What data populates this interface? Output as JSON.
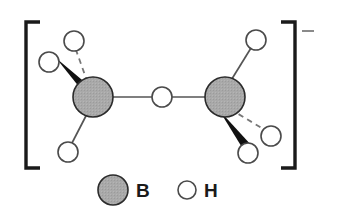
{
  "figure": {
    "charge_symbol": "–",
    "colors": {
      "boron_fill": "#a8a8a8",
      "boron_stroke": "#2b2b2b",
      "hydrogen_fill": "#ffffff",
      "hydrogen_stroke": "#4a4a4a",
      "bond": "#555555",
      "wedge": "#111111",
      "bracket": "#1a1a1a",
      "background": "#ffffff",
      "label_text": "#1a1a1a",
      "charge_text": "#7a7a7a"
    },
    "brackets": {
      "left": {
        "x": 26,
        "top": 22,
        "bottom": 168,
        "arm": 14
      },
      "right": {
        "x": 295,
        "top": 22,
        "bottom": 168,
        "arm": 14
      }
    },
    "charge": {
      "x": 308,
      "y": 32
    },
    "atoms": [
      {
        "id": "B1",
        "element": "B",
        "kind": "boron",
        "cx": 93,
        "cy": 97,
        "r": 20
      },
      {
        "id": "B2",
        "element": "B",
        "kind": "boron",
        "cx": 225,
        "cy": 97,
        "r": 20
      },
      {
        "id": "Hb",
        "element": "H",
        "kind": "hydrogen",
        "cx": 162,
        "cy": 97,
        "r": 10,
        "role": "bridging"
      },
      {
        "id": "H1",
        "element": "H",
        "kind": "hydrogen",
        "cx": 74,
        "cy": 41,
        "r": 10
      },
      {
        "id": "H2",
        "element": "H",
        "kind": "hydrogen",
        "cx": 49,
        "cy": 62,
        "r": 10
      },
      {
        "id": "H3",
        "element": "H",
        "kind": "hydrogen",
        "cx": 68,
        "cy": 152,
        "r": 10
      },
      {
        "id": "H4",
        "element": "H",
        "kind": "hydrogen",
        "cx": 256,
        "cy": 40,
        "r": 10
      },
      {
        "id": "H5",
        "element": "H",
        "kind": "hydrogen",
        "cx": 248,
        "cy": 153,
        "r": 10
      },
      {
        "id": "H6",
        "element": "H",
        "kind": "hydrogen",
        "cx": 271,
        "cy": 136,
        "r": 10
      }
    ],
    "bonds": [
      {
        "from": "B1",
        "to": "Hb",
        "style": "plain"
      },
      {
        "from": "Hb",
        "to": "B2",
        "style": "plain"
      },
      {
        "from": "B1",
        "to": "H1",
        "style": "dashed"
      },
      {
        "from": "B1",
        "to": "H2",
        "style": "wedge"
      },
      {
        "from": "B1",
        "to": "H3",
        "style": "plain"
      },
      {
        "from": "B2",
        "to": "H4",
        "style": "plain"
      },
      {
        "from": "B2",
        "to": "H5",
        "style": "wedge"
      },
      {
        "from": "B2",
        "to": "H6",
        "style": "dashed"
      }
    ],
    "legend": {
      "items": [
        {
          "symbol": "B",
          "kind": "boron",
          "cx": 113,
          "cy": 190,
          "r": 15,
          "label_x": 137,
          "label_y": 197
        },
        {
          "symbol": "H",
          "kind": "hydrogen",
          "cx": 187,
          "cy": 190,
          "r": 9,
          "label_x": 205,
          "label_y": 197
        }
      ]
    }
  }
}
